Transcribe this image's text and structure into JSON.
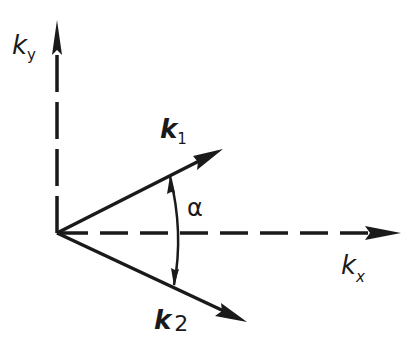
{
  "diagram": {
    "ink_color": "#1a1a1a",
    "background": "#ffffff",
    "origin": [
      57,
      233
    ],
    "axes": {
      "ky": {
        "label": "k",
        "subscript": "y",
        "tip": [
          57,
          22
        ],
        "style": "dashed"
      },
      "kx": {
        "label": "k",
        "subscript": "x",
        "tip": [
          400,
          233
        ],
        "style": "dashed"
      }
    },
    "vectors": [
      {
        "id": "k1",
        "label": "k",
        "subscript": "1",
        "tip": [
          222,
          150
        ],
        "style": "solid"
      },
      {
        "id": "k2",
        "label": "k",
        "subscript": "2",
        "tip": [
          246,
          321
        ],
        "style": "solid"
      }
    ],
    "angle": {
      "symbol": "α",
      "between": [
        "k1",
        "k2"
      ]
    }
  }
}
